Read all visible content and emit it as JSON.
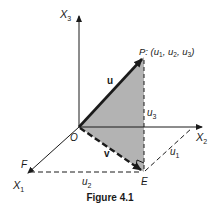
{
  "figure": {
    "caption": "Figure 4.1",
    "colors": {
      "ink": "#1a1a1a",
      "shade": "#b3b3b3",
      "background": "#ffffff"
    }
  },
  "axes": {
    "x1": {
      "label": "X",
      "sub": "1"
    },
    "x2": {
      "label": "X",
      "sub": "2"
    },
    "x3": {
      "label": "X",
      "sub": "3"
    }
  },
  "points": {
    "origin": "O",
    "p": {
      "name": "P",
      "coords_prefix": ": (",
      "u": "u",
      "s1": "1",
      "s2": "2",
      "s3": "3",
      "sep": ", ",
      "close": ")"
    },
    "e": "E",
    "f": "F"
  },
  "vectors": {
    "u": "u",
    "v": "v"
  },
  "components": {
    "u1": {
      "label": "u",
      "sub": "1"
    },
    "u2": {
      "label": "u",
      "sub": "2"
    },
    "u3": {
      "label": "u",
      "sub": "3"
    }
  }
}
